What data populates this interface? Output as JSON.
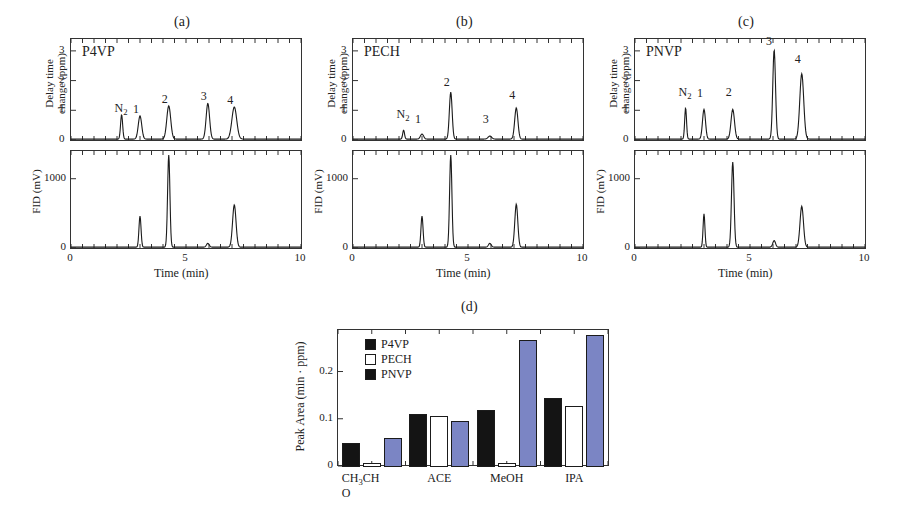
{
  "figure": {
    "panels": [
      {
        "id": "a",
        "caption": "(a)",
        "sample": "P4VP",
        "top": {
          "ylabel_line1": "Delay time",
          "ylabel_line2": "change (ppm)",
          "yticks": [
            "0",
            "1",
            "2",
            "3"
          ],
          "ylim": [
            0,
            3.4
          ],
          "peak_labels": [
            "N₂",
            "1",
            "2",
            "3",
            "4"
          ]
        },
        "bottom": {
          "ylabel": "FID (mV)",
          "yticks": [
            "0",
            "1000"
          ],
          "ylim": [
            0,
            1400
          ]
        },
        "xlabel": "Time (min)",
        "xticks": [
          "0",
          "5",
          "10"
        ],
        "xlim": [
          0,
          10
        ]
      },
      {
        "id": "b",
        "caption": "(b)",
        "sample": "PECH",
        "top": {
          "ylabel_line1": "Delay time",
          "ylabel_line2": "change (ppm)",
          "yticks": [
            "0",
            "1",
            "2",
            "3"
          ],
          "ylim": [
            0,
            3.4
          ],
          "peak_labels": [
            "N₂",
            "1",
            "2",
            "3",
            "4"
          ]
        },
        "bottom": {
          "ylabel": "FID (mV)",
          "yticks": [
            "0",
            "1000"
          ],
          "ylim": [
            0,
            1400
          ]
        },
        "xlabel": "Time (min)",
        "xticks": [
          "0",
          "5",
          "10"
        ],
        "xlim": [
          0,
          10
        ]
      },
      {
        "id": "c",
        "caption": "(c)",
        "sample": "PNVP",
        "top": {
          "ylabel_line1": "Delay time",
          "ylabel_line2": "change (ppm)",
          "yticks": [
            "0",
            "1",
            "2",
            "3"
          ],
          "ylim": [
            0,
            3.4
          ],
          "peak_labels": [
            "N₂",
            "1",
            "2",
            "3",
            "4"
          ]
        },
        "bottom": {
          "ylabel": "FID (mV)",
          "yticks": [
            "0",
            "1000"
          ],
          "ylim": [
            0,
            1400
          ]
        },
        "xlabel": "Time (min)",
        "xticks": [
          "0",
          "5",
          "10"
        ],
        "xlim": [
          0,
          10
        ]
      }
    ],
    "panel_d": {
      "caption": "(d)"
    }
  },
  "chart_data": [
    {
      "type": "line",
      "id": "a-top",
      "title": "P4VP",
      "xlabel": "Time (min)",
      "ylabel": "Delay time change (ppm)",
      "xlim": [
        0,
        10
      ],
      "ylim": [
        0,
        3.4
      ],
      "xticks": [
        0,
        5,
        10
      ],
      "yticks": [
        0,
        1,
        2,
        3
      ],
      "grid": false,
      "annotations": [
        {
          "label": "N₂",
          "x": 2.2,
          "y": 0.82
        },
        {
          "label": "1",
          "x": 3.0,
          "y": 0.78
        },
        {
          "label": "2",
          "x": 4.25,
          "y": 1.12
        },
        {
          "label": "3",
          "x": 5.95,
          "y": 1.2
        },
        {
          "label": "4",
          "x": 7.1,
          "y": 1.08
        }
      ],
      "peaks": [
        {
          "name": "N₂",
          "x": 2.2,
          "height": 0.82,
          "width": 0.045
        },
        {
          "name": "1",
          "x": 3.0,
          "height": 0.78,
          "width": 0.075
        },
        {
          "name": "2",
          "x": 4.25,
          "height": 1.12,
          "width": 0.085
        },
        {
          "name": "3",
          "x": 5.95,
          "height": 1.2,
          "width": 0.075
        },
        {
          "name": "4",
          "x": 7.1,
          "height": 1.08,
          "width": 0.105
        }
      ]
    },
    {
      "type": "line",
      "id": "a-bottom",
      "title": "P4VP FID",
      "xlabel": "Time (min)",
      "ylabel": "FID (mV)",
      "xlim": [
        0,
        10
      ],
      "ylim": [
        0,
        1400
      ],
      "xticks": [
        0,
        5,
        10
      ],
      "yticks": [
        0,
        1000
      ],
      "grid": false,
      "peaks": [
        {
          "name": "1",
          "x": 3.0,
          "height": 450,
          "width": 0.045
        },
        {
          "name": "2",
          "x": 4.25,
          "height": 1330,
          "width": 0.05
        },
        {
          "name": "3",
          "x": 5.95,
          "height": 55,
          "width": 0.06
        },
        {
          "name": "4",
          "x": 7.1,
          "height": 610,
          "width": 0.075
        }
      ]
    },
    {
      "type": "line",
      "id": "b-top",
      "title": "PECH",
      "xlabel": "Time (min)",
      "ylabel": "Delay time change (ppm)",
      "xlim": [
        0,
        10
      ],
      "ylim": [
        0,
        3.4
      ],
      "xticks": [
        0,
        5,
        10
      ],
      "yticks": [
        0,
        1,
        2,
        3
      ],
      "grid": false,
      "annotations": [
        {
          "label": "N₂",
          "x": 2.2,
          "y": 0.62
        },
        {
          "label": "1",
          "x": 3.0,
          "y": 0.45
        },
        {
          "label": "2",
          "x": 4.25,
          "y": 1.68
        },
        {
          "label": "3",
          "x": 5.95,
          "y": 0.45
        },
        {
          "label": "4",
          "x": 7.1,
          "y": 1.25
        }
      ],
      "peaks": [
        {
          "name": "N₂",
          "x": 2.2,
          "height": 0.3,
          "width": 0.04
        },
        {
          "name": "1",
          "x": 3.0,
          "height": 0.17,
          "width": 0.07
        },
        {
          "name": "2",
          "x": 4.25,
          "height": 1.58,
          "width": 0.06
        },
        {
          "name": "3",
          "x": 5.95,
          "height": 0.1,
          "width": 0.08
        },
        {
          "name": "4",
          "x": 7.1,
          "height": 1.05,
          "width": 0.07
        }
      ]
    },
    {
      "type": "line",
      "id": "b-bottom",
      "title": "PECH FID",
      "xlabel": "Time (min)",
      "ylabel": "FID (mV)",
      "xlim": [
        0,
        10
      ],
      "ylim": [
        0,
        1400
      ],
      "xticks": [
        0,
        5,
        10
      ],
      "yticks": [
        0,
        1000
      ],
      "grid": false,
      "peaks": [
        {
          "name": "1",
          "x": 3.0,
          "height": 450,
          "width": 0.045
        },
        {
          "name": "2",
          "x": 4.25,
          "height": 1330,
          "width": 0.05
        },
        {
          "name": "3",
          "x": 5.95,
          "height": 55,
          "width": 0.06
        },
        {
          "name": "4",
          "x": 7.1,
          "height": 620,
          "width": 0.065
        }
      ]
    },
    {
      "type": "line",
      "id": "c-top",
      "title": "PNVP",
      "xlabel": "Time (min)",
      "ylabel": "Delay time change (ppm)",
      "xlim": [
        0,
        10
      ],
      "ylim": [
        0,
        3.4
      ],
      "xticks": [
        0,
        5,
        10
      ],
      "yticks": [
        0,
        1,
        2,
        3
      ],
      "grid": false,
      "annotations": [
        {
          "label": "N₂",
          "x": 2.2,
          "y": 1.35
        },
        {
          "label": "1",
          "x": 3.0,
          "y": 1.3
        },
        {
          "label": "2",
          "x": 4.25,
          "y": 1.35
        },
        {
          "label": "3",
          "x": 6.0,
          "y": 3.05
        },
        {
          "label": "4",
          "x": 7.25,
          "y": 2.45
        }
      ],
      "peaks": [
        {
          "name": "N₂",
          "x": 2.2,
          "height": 1.05,
          "width": 0.04
        },
        {
          "name": "1",
          "x": 3.0,
          "height": 1.0,
          "width": 0.065
        },
        {
          "name": "2",
          "x": 4.25,
          "height": 1.0,
          "width": 0.075
        },
        {
          "name": "3",
          "x": 6.05,
          "height": 3.0,
          "width": 0.06
        },
        {
          "name": "4",
          "x": 7.25,
          "height": 2.2,
          "width": 0.085
        }
      ]
    },
    {
      "type": "line",
      "id": "c-bottom",
      "title": "PNVP FID",
      "xlabel": "Time (min)",
      "ylabel": "FID (mV)",
      "xlim": [
        0,
        10
      ],
      "ylim": [
        0,
        1400
      ],
      "xticks": [
        0,
        1000
      ],
      "yticks": [
        0,
        1000
      ],
      "grid": false,
      "peaks": [
        {
          "name": "1",
          "x": 3.0,
          "height": 480,
          "width": 0.04
        },
        {
          "name": "2",
          "x": 4.25,
          "height": 1230,
          "width": 0.055
        },
        {
          "name": "3",
          "x": 6.05,
          "height": 95,
          "width": 0.06
        },
        {
          "name": "4",
          "x": 7.25,
          "height": 590,
          "width": 0.075
        }
      ]
    },
    {
      "type": "bar",
      "id": "d",
      "title": "(d)",
      "xlabel": "",
      "ylabel": "Peak Area (min · ppm)",
      "categories": [
        "CH₃CHO",
        "ACE",
        "MeOH",
        "IPA"
      ],
      "category_lines": [
        [
          "CH",
          "3",
          "CH",
          "O"
        ],
        [
          "ACE"
        ],
        [
          "MeOH"
        ],
        [
          "IPA"
        ]
      ],
      "ylim": [
        0,
        0.29
      ],
      "yticks": [
        0,
        0.1,
        0.2
      ],
      "ytick_labels": [
        "0",
        "0.1",
        "0.2"
      ],
      "grid": false,
      "legend_position": "top-left",
      "series": [
        {
          "name": "P4VP",
          "color": "#141414",
          "fill": "solid",
          "values": [
            0.05,
            0.113,
            0.121,
            0.147
          ]
        },
        {
          "name": "PECH",
          "color": "#ffffff",
          "fill": "hollow",
          "values": [
            0.008,
            0.108,
            0.009,
            0.129
          ]
        },
        {
          "name": "PNVP",
          "color": "#7b85c4",
          "fill": "solid",
          "values": [
            0.061,
            0.098,
            0.268,
            0.28
          ]
        }
      ]
    }
  ],
  "colors": {
    "ink": "#1b1b1b",
    "pnvp_bar": "#7b85c4",
    "p4vp_bar": "#141414",
    "pech_bar": "#ffffff"
  }
}
